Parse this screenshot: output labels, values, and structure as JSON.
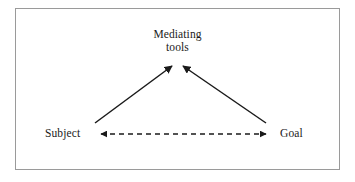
{
  "figure": {
    "type": "activity-theory-triangle",
    "background_color": "#ffffff",
    "frame": {
      "border_color": "#9a9a9a",
      "border_width_px": 1,
      "x": 15,
      "y": 8,
      "width": 325,
      "height": 162
    },
    "stroke_color": "#1a1a1a",
    "text_color": "#1a1a1a"
  },
  "nodes": {
    "apex": {
      "id": "mediating-tools",
      "label_line1": "Mediating",
      "label_line2": "tools",
      "x": 177,
      "y": 42
    },
    "bottom_left": {
      "id": "subject",
      "label": "Subject",
      "x": 67,
      "y": 133
    },
    "bottom_right": {
      "id": "goal",
      "label": "Goal",
      "x": 293,
      "y": 133
    }
  },
  "edges": [
    {
      "id": "subject-to-mediating-tools",
      "from": "subject",
      "to": "mediating-tools",
      "style": "solid",
      "arrowheads": "end",
      "x1": 95,
      "y1": 123,
      "x2": 172,
      "y2": 66
    },
    {
      "id": "goal-to-mediating-tools",
      "from": "goal",
      "to": "mediating-tools",
      "style": "solid",
      "arrowheads": "start",
      "x1": 183,
      "y1": 66,
      "x2": 266,
      "y2": 123
    },
    {
      "id": "subject-goal-bidirectional",
      "from": "subject",
      "to": "goal",
      "style": "dashed",
      "arrowheads": "both",
      "x1": 99,
      "y1": 134,
      "x2": 268,
      "y2": 134,
      "dash_pattern": "5 4"
    }
  ]
}
